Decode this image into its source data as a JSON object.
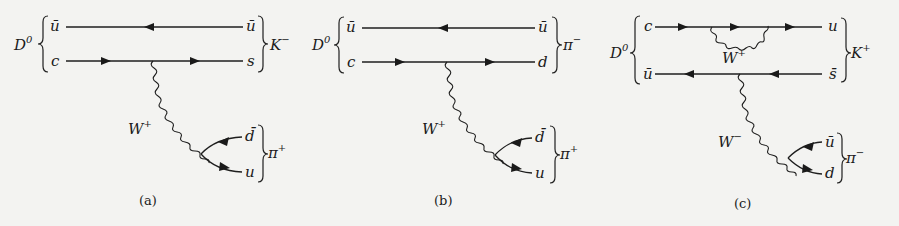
{
  "figure": {
    "diagrams": [
      {
        "id": "a",
        "caption": "(a)",
        "initial_meson": "D",
        "initial_meson_sup": "0",
        "top_quark_in": "ū",
        "bottom_quark_in": "c",
        "top_quark_out": "ū",
        "bottom_quark_out": "s",
        "final_meson_1": "K",
        "final_meson_1_sup": "−",
        "boson": "W",
        "boson_sup": "+",
        "pair_top": "d̄",
        "pair_bottom": "u",
        "final_meson_2": "π",
        "final_meson_2_sup": "+"
      },
      {
        "id": "b",
        "caption": "(b)",
        "initial_meson": "D",
        "initial_meson_sup": "0",
        "top_quark_in": "ū",
        "bottom_quark_in": "c",
        "top_quark_out": "ū",
        "bottom_quark_out": "d",
        "final_meson_1": "π",
        "final_meson_1_sup": "−",
        "boson": "W",
        "boson_sup": "+",
        "pair_top": "d̄",
        "pair_bottom": "u",
        "final_meson_2": "π",
        "final_meson_2_sup": "+"
      },
      {
        "id": "c",
        "caption": "(c)",
        "initial_meson": "D",
        "initial_meson_sup": "0",
        "top_quark_in": "c",
        "bottom_quark_in": "ū",
        "top_quark_out": "u",
        "bottom_quark_out": "s̄",
        "final_meson_1": "K",
        "final_meson_1_sup": "+",
        "loop_boson": "W",
        "loop_boson_sup": "+",
        "boson": "W",
        "boson_sup": "−",
        "pair_top": "ū",
        "pair_bottom": "d",
        "final_meson_2": "π",
        "final_meson_2_sup": "−"
      }
    ]
  }
}
